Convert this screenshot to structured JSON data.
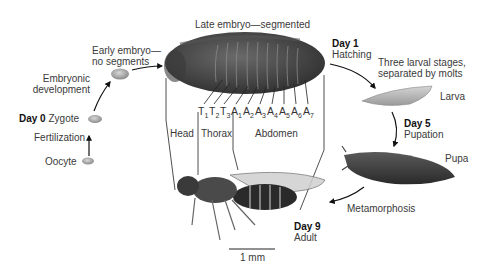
{
  "diagram": {
    "stages": {
      "oocyte": "Oocyte",
      "fertilization": "Fertilization",
      "day0": "Day 0",
      "zygote": "Zygote",
      "embryonic_development": [
        "Embryonic",
        "development"
      ],
      "early_embryo": [
        "Early embryo—",
        "no segments"
      ],
      "late_embryo": "Late embryo—segmented",
      "day1": "Day 1",
      "hatching": "Hatching",
      "larval_note": [
        "Three larval stages,",
        "separated by molts"
      ],
      "larva": "Larva",
      "day5": "Day 5",
      "pupation": "Pupation",
      "pupa": "Pupa",
      "metamorphosis": "Metamorphosis",
      "day9": "Day 9",
      "adult": "Adult"
    },
    "segments": [
      {
        "letter": "T",
        "sub": "1"
      },
      {
        "letter": "T",
        "sub": "2"
      },
      {
        "letter": "T",
        "sub": "3"
      },
      {
        "letter": "A",
        "sub": "1"
      },
      {
        "letter": "A",
        "sub": "2"
      },
      {
        "letter": "A",
        "sub": "3"
      },
      {
        "letter": "A",
        "sub": "4"
      },
      {
        "letter": "A",
        "sub": "5"
      },
      {
        "letter": "A",
        "sub": "6"
      },
      {
        "letter": "A",
        "sub": "7"
      }
    ],
    "body_regions": {
      "head": "Head",
      "thorax": "Thorax",
      "abdomen": "Abdomen"
    },
    "scale_bar": "1 mm"
  }
}
